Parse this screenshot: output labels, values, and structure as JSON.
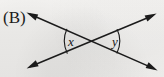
{
  "figure": {
    "panel_label": "(B)",
    "background_color": "#f4f3f1",
    "ink_color": "#1b1b1b",
    "width": 164,
    "height": 77,
    "intersection": {
      "x": 92,
      "y": 41
    },
    "lines": [
      {
        "name": "line-up-right",
        "from": {
          "x": 27,
          "y": 68
        },
        "to": {
          "x": 156,
          "y": 14
        },
        "arrow_start": true,
        "arrow_end": true
      },
      {
        "name": "line-down-right",
        "from": {
          "x": 27,
          "y": 13
        },
        "to": {
          "x": 157,
          "y": 70
        },
        "arrow_start": true,
        "arrow_end": true
      }
    ],
    "angles": [
      {
        "name": "angle-x",
        "label": "x",
        "position": "left",
        "label_x": 68,
        "label_y": 35,
        "arc": {
          "cx": 92,
          "cy": 41,
          "radius": 26
        }
      },
      {
        "name": "angle-y",
        "label": "y",
        "position": "right",
        "label_x": 112,
        "label_y": 35,
        "arc": {
          "cx": 92,
          "cy": 41,
          "radius": 26
        }
      }
    ]
  }
}
